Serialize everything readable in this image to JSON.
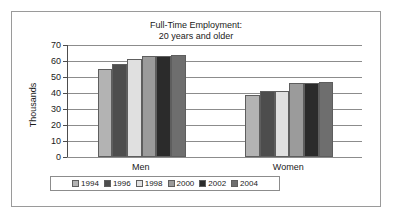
{
  "chart_data": {
    "type": "bar",
    "title": "Full-Time Employment:",
    "subtitle": "20 years and older",
    "title_lines": [
      "Full-Time Employment:",
      "20 years and older"
    ],
    "xlabel": "",
    "ylabel": "Thousands",
    "ylim": [
      0,
      70
    ],
    "ytick_step": 10,
    "yticks": [
      70,
      60,
      50,
      40,
      30,
      20,
      10,
      0
    ],
    "ytick_labels": [
      "70",
      "60",
      "50",
      "40",
      "30",
      "20",
      "10",
      "0"
    ],
    "grid": true,
    "grid_axis": "y",
    "legend_position": "bottom",
    "categories": [
      "Men",
      "Women"
    ],
    "series": [
      {
        "name": "1994",
        "color": "#b3b3b3",
        "values": [
          55,
          39
        ]
      },
      {
        "name": "1996",
        "color": "#4d4d4d",
        "values": [
          58,
          41
        ]
      },
      {
        "name": "1998",
        "color": "#e0e0e0",
        "values": [
          61,
          41
        ]
      },
      {
        "name": "2000",
        "color": "#9b9b9b",
        "values": [
          63,
          46
        ]
      },
      {
        "name": "2002",
        "color": "#2b2b2b",
        "values": [
          63,
          46
        ]
      },
      {
        "name": "2004",
        "color": "#6e6e6e",
        "values": [
          64,
          47
        ]
      }
    ]
  }
}
